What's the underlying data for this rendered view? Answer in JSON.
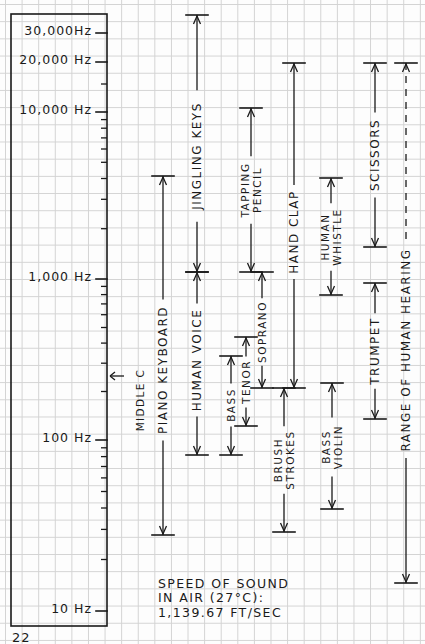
{
  "page_number": "22",
  "axis": {
    "labels": [
      {
        "text": "30,000Hz",
        "y": 33
      },
      {
        "text": "20,000 Hz",
        "y": 62
      },
      {
        "text": "10,000 Hz",
        "y": 112
      },
      {
        "text": "1,000 Hz",
        "y": 279
      },
      {
        "text": "100 Hz",
        "y": 440
      },
      {
        "text": "10 Hz",
        "y": 611
      }
    ],
    "scale": "logarithmic"
  },
  "middle_c": {
    "label": "MIDDLE C",
    "y": 376
  },
  "ranges": [
    {
      "id": "piano-keyboard",
      "label": "PIANO KEYBOARD",
      "x": 163,
      "top": 176,
      "bottom": 535,
      "label_y": 370
    },
    {
      "id": "jingling-keys",
      "label": "JINGLING KEYS",
      "x": 197,
      "top": 15,
      "bottom": 272,
      "label_y": 156
    },
    {
      "id": "human-voice",
      "label": "HUMAN VOICE",
      "x": 197,
      "top": 272,
      "bottom": 455,
      "label_y": 360
    },
    {
      "id": "tapping-pencil",
      "label": [
        "TAPPING",
        "PENCIL"
      ],
      "x": 251,
      "top": 108,
      "bottom": 272,
      "label_y": 190
    },
    {
      "id": "bass",
      "label": "BASS",
      "x": 231,
      "top": 356,
      "bottom": 455,
      "label_y": 405
    },
    {
      "id": "tenor",
      "label": "TENOR",
      "x": 246,
      "top": 337,
      "bottom": 426,
      "label_y": 382
    },
    {
      "id": "soprano",
      "label": "SOPRANO",
      "x": 262,
      "top": 272,
      "bottom": 388,
      "label_y": 332
    },
    {
      "id": "hand-clap",
      "label": "HAND CLAP",
      "x": 294,
      "top": 63,
      "bottom": 388,
      "label_y": 232
    },
    {
      "id": "brush-strokes",
      "label": [
        "BRUSH",
        "STROKES"
      ],
      "x": 284,
      "top": 388,
      "bottom": 532,
      "label_y": 460
    },
    {
      "id": "human-whistle",
      "label": [
        "HUMAN",
        "WHISTLE"
      ],
      "x": 331,
      "top": 178,
      "bottom": 295,
      "label_y": 237
    },
    {
      "id": "bass-violin",
      "label": [
        "BASS",
        "VIOLIN"
      ],
      "x": 332,
      "top": 383,
      "bottom": 509,
      "label_y": 447
    },
    {
      "id": "scissors",
      "label": "SCISSORS",
      "x": 375,
      "top": 63,
      "bottom": 247,
      "label_y": 155
    },
    {
      "id": "trumpet",
      "label": "TRUMPET",
      "x": 375,
      "top": 283,
      "bottom": 419,
      "label_y": 351
    },
    {
      "id": "range-of-human-hearing",
      "label": "RANGE OF HUMAN HEARING",
      "x": 406,
      "top": 63,
      "bottom": 583,
      "label_y": 350
    }
  ],
  "note": {
    "lines": [
      "SPEED OF SOUND",
      "IN AIR (27°C):",
      "1,139.67 FT/SEC"
    ]
  }
}
